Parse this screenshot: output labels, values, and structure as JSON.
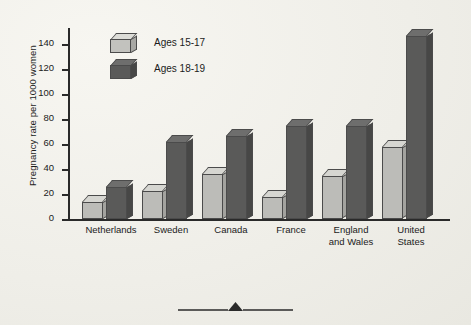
{
  "chart_data": {
    "type": "bar",
    "title": "",
    "xlabel": "",
    "ylabel": "Pregnancy rate per 1000 women",
    "ylim": [
      0,
      150
    ],
    "yticks": [
      0,
      20,
      40,
      60,
      80,
      100,
      120,
      140
    ],
    "grid": false,
    "legend_position": "inside-top-left",
    "categories": [
      "Netherlands",
      "Sweden",
      "Canada",
      "France",
      "England\nand Wales",
      "United\nStates"
    ],
    "series": [
      {
        "name": "Ages 15-17",
        "color": "#bcbcb8",
        "values": [
          13,
          22,
          35,
          17,
          33,
          56
        ]
      },
      {
        "name": "Ages 18-19",
        "color": "#5a5a59",
        "values": [
          25,
          60,
          65,
          73,
          73,
          143
        ]
      }
    ]
  },
  "axis": {
    "y_title": "Pregnancy rate per 1000 women",
    "tick_labels": [
      "140",
      "120",
      "100",
      "80",
      "60",
      "40",
      "20",
      "0"
    ]
  },
  "legend": {
    "items": [
      {
        "label": "Ages 15-17",
        "swatch": "light-cube-icon"
      },
      {
        "label": "Ages 18-19",
        "swatch": "dark-cube-icon"
      }
    ]
  },
  "categories": [
    {
      "line1": "Netherlands",
      "line2": ""
    },
    {
      "line1": "Sweden",
      "line2": ""
    },
    {
      "line1": "Canada",
      "line2": ""
    },
    {
      "line1": "France",
      "line2": ""
    },
    {
      "line1": "England",
      "line2": "and Wales"
    },
    {
      "line1": "United",
      "line2": "States"
    }
  ],
  "ornament": {
    "name": "triangle-divider-icon"
  }
}
